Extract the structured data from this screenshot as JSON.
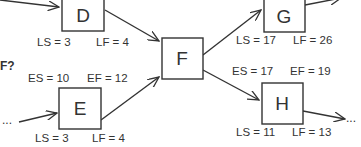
{
  "diagram": {
    "question_fragment": "F?",
    "ellipsis": "...",
    "colors": {
      "stroke": "#333333",
      "background": "#ffffff"
    },
    "nodes": {
      "D": {
        "label": "D",
        "ls": "LS = 3",
        "lf": "LF = 4"
      },
      "E": {
        "label": "E",
        "es": "ES = 10",
        "ef": "EF = 12",
        "ls": "LS = 3",
        "lf": "LF = 4"
      },
      "F": {
        "label": "F"
      },
      "G": {
        "label": "G",
        "ls": "LS = 17",
        "lf": "LF = 26"
      },
      "H": {
        "label": "H",
        "es": "ES = 17",
        "ef": "EF = 19",
        "ls": "LS = 11",
        "lf": "LF = 13"
      }
    },
    "edges": [
      {
        "from": "offscreen",
        "to": "D"
      },
      {
        "from": "ellipsis",
        "to": "E"
      },
      {
        "from": "D",
        "to": "F"
      },
      {
        "from": "E",
        "to": "F"
      },
      {
        "from": "F",
        "to": "G"
      },
      {
        "from": "F",
        "to": "H"
      },
      {
        "from": "G",
        "to": "offscreen"
      },
      {
        "from": "H",
        "to": "ellipsis"
      }
    ]
  }
}
